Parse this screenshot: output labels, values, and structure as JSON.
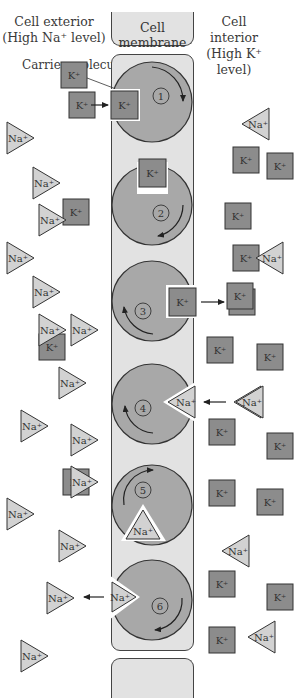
{
  "headers": {
    "exterior": [
      "Cell exterior",
      "(High Na⁺ level)"
    ],
    "membrane": "Cell membrane",
    "interior": [
      "Cell interior",
      "(High K⁺ level)"
    ]
  },
  "annotation": {
    "carrier_label": "Carrier molecule"
  },
  "ion_labels": {
    "potassium": "K⁺",
    "sodium": "Na⁺"
  },
  "colors": {
    "membrane_fill": "#e2e2e2",
    "carrier_fill": "#a8a8a8",
    "potassium_fill": "#8c8c8c",
    "sodium_fill": "#d2d2d2",
    "outline": "#333333"
  },
  "carrier_steps": [
    {
      "step": "1",
      "bound_ion": "K⁺",
      "event": "K⁺ enters carrier from exterior"
    },
    {
      "step": "2",
      "bound_ion": "K⁺",
      "event": "Carrier rotates K⁺"
    },
    {
      "step": "3",
      "bound_ion": "K⁺",
      "event": "K⁺ released to interior"
    },
    {
      "step": "4",
      "bound_ion": "Na⁺",
      "event": "Na⁺ enters carrier from interior"
    },
    {
      "step": "5",
      "bound_ion": "Na⁺",
      "event": "Carrier rotates Na⁺"
    },
    {
      "step": "6",
      "bound_ion": "Na⁺",
      "event": "Na⁺ released to exterior"
    }
  ],
  "exterior_ions": {
    "potassium": [
      [
        74,
        75
      ],
      [
        76,
        212
      ],
      [
        52,
        347
      ],
      [
        76,
        482
      ]
    ],
    "sodium": [
      [
        20,
        138
      ],
      [
        46,
        183
      ],
      [
        52,
        220
      ],
      [
        20,
        258
      ],
      [
        46,
        292
      ],
      [
        52,
        330
      ],
      [
        84,
        330
      ],
      [
        72,
        383
      ],
      [
        34,
        426
      ],
      [
        84,
        440
      ],
      [
        84,
        482
      ],
      [
        20,
        514
      ],
      [
        72,
        546
      ],
      [
        60,
        598
      ],
      [
        34,
        656
      ]
    ]
  },
  "interior_ions": {
    "potassium": [
      [
        246,
        160
      ],
      [
        280,
        166
      ],
      [
        238,
        216
      ],
      [
        246,
        258
      ],
      [
        240,
        296
      ],
      [
        220,
        350
      ],
      [
        270,
        357
      ],
      [
        222,
        432
      ],
      [
        280,
        446
      ],
      [
        222,
        493
      ],
      [
        270,
        502
      ],
      [
        222,
        584
      ],
      [
        280,
        597
      ],
      [
        222,
        640
      ]
    ],
    "sodium": [
      [
        256,
        124
      ],
      [
        270,
        258
      ],
      [
        250,
        402
      ],
      [
        236,
        551
      ],
      [
        262,
        637
      ]
    ]
  }
}
